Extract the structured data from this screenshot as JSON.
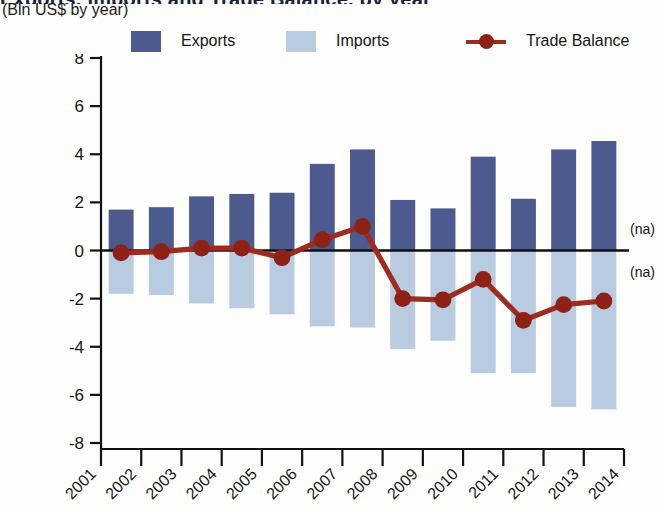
{
  "header": {
    "title_partial": "Exports, Imports and Trade Balance, by year",
    "subtitle": "(Bln US$ by year)"
  },
  "legend": {
    "position": "top",
    "items": [
      {
        "label": "Exports",
        "marker": "square",
        "color": "#4c5a8e",
        "icon": "legend-swatch-exports"
      },
      {
        "label": "Imports",
        "marker": "square",
        "color": "#b9cbe0",
        "icon": "legend-swatch-imports"
      },
      {
        "label": "Trade Balance",
        "marker": "line-dot",
        "color": "#9e2b20",
        "icon": "legend-marker-trade-balance"
      }
    ]
  },
  "annotations": [
    {
      "text": "(na)",
      "x": 2014,
      "y": 0.9
    },
    {
      "text": "(na)",
      "x": 2014,
      "y": -0.9
    }
  ],
  "chart_data": {
    "type": "bar",
    "title": "Exports, Imports and Trade Balance, by year",
    "subtitle": "(Bln US$ by year)",
    "xlabel": "",
    "ylabel": "",
    "ylim": [
      -8,
      8
    ],
    "yticks": [
      8,
      6,
      4,
      2,
      0,
      -2,
      -4,
      -6,
      -8
    ],
    "ytick_labels": [
      "8",
      "6",
      "4",
      "2",
      "0",
      "-2",
      "-4",
      "-6",
      "-8"
    ],
    "xticks": [
      2001,
      2002,
      2003,
      2004,
      2005,
      2006,
      2007,
      2008,
      2009,
      2010,
      2011,
      2012,
      2013,
      2014
    ],
    "xtick_labels": [
      "2001",
      "2002",
      "2003",
      "2004",
      "2005",
      "2006",
      "2007",
      "2008",
      "2009",
      "2010",
      "2011",
      "2012",
      "2013",
      "2014"
    ],
    "categories": [
      "2001",
      "2002",
      "2003",
      "2004",
      "2005",
      "2006",
      "2007",
      "2008",
      "2009",
      "2010",
      "2011",
      "2012",
      "2013"
    ],
    "grid": false,
    "zero_line": true,
    "series": [
      {
        "name": "Exports",
        "type": "bar",
        "color": "#4c5a8e",
        "values": [
          1.7,
          1.8,
          2.25,
          2.35,
          2.4,
          3.6,
          4.2,
          2.1,
          1.75,
          3.9,
          2.15,
          4.2,
          4.55
        ]
      },
      {
        "name": "Imports",
        "type": "bar",
        "color": "#b9cbe0",
        "values": [
          -1.8,
          -1.85,
          -2.2,
          -2.4,
          -2.65,
          -3.15,
          -3.2,
          -4.1,
          -3.75,
          -5.1,
          -5.1,
          -6.5,
          -6.6
        ]
      },
      {
        "name": "Trade Balance",
        "type": "line",
        "color": "#9e2b20",
        "values": [
          -0.1,
          -0.05,
          0.1,
          0.1,
          -0.3,
          0.45,
          1.0,
          -2.0,
          -2.05,
          -1.2,
          -2.9,
          -2.25,
          -2.1
        ]
      }
    ]
  }
}
